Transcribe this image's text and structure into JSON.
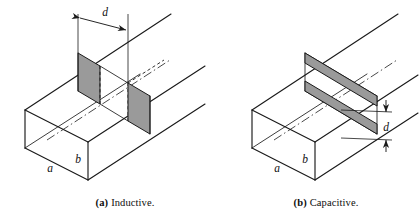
{
  "figure": {
    "background_color": "#ffffff",
    "line_color": "#1a1a1a",
    "iris_fill_color": "#9a9a9a",
    "panels": [
      {
        "id": "inductive",
        "caption_tag": "(a)",
        "caption_text": "Inductive.",
        "iris_orientation": "vertical",
        "iris_count": 2,
        "dimension_labels": [
          "a",
          "b",
          "d"
        ],
        "dimension_d_orientation": "horizontal",
        "labels": {
          "a": "a",
          "b": "b",
          "d": "d"
        }
      },
      {
        "id": "capacitive",
        "caption_tag": "(b)",
        "caption_text": "Capacitive.",
        "iris_orientation": "horizontal",
        "iris_count": 2,
        "dimension_labels": [
          "a",
          "b",
          "d"
        ],
        "dimension_d_orientation": "vertical",
        "labels": {
          "a": "a",
          "b": "b",
          "d": "d"
        }
      }
    ]
  }
}
